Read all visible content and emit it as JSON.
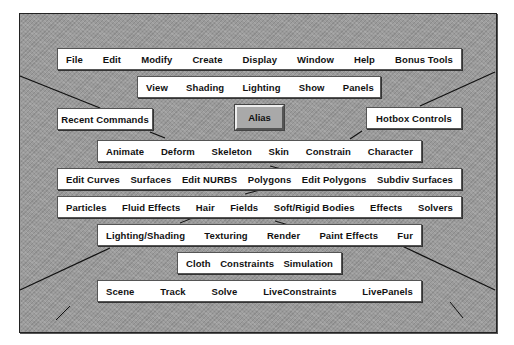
{
  "hotbox": {
    "center_button": "Alias",
    "recent_commands": "Recent Commands",
    "hotbox_controls": "Hotbox Controls",
    "rows": {
      "main_menus": [
        "File",
        "Edit",
        "Modify",
        "Create",
        "Display",
        "Window",
        "Help",
        "Bonus Tools"
      ],
      "panel_menus": [
        "View",
        "Shading",
        "Lighting",
        "Show",
        "Panels"
      ],
      "animation": [
        "Animate",
        "Deform",
        "Skeleton",
        "Skin",
        "Constrain",
        "Character"
      ],
      "modeling": [
        "Edit Curves",
        "Surfaces",
        "Edit NURBS",
        "Polygons",
        "Edit Polygons",
        "Subdiv Surfaces"
      ],
      "dynamics": [
        "Particles",
        "Fluid Effects",
        "Hair",
        "Fields",
        "Soft/Rigid Bodies",
        "Effects",
        "Solvers"
      ],
      "rendering": [
        "Lighting/Shading",
        "Texturing",
        "Render",
        "Paint Effects",
        "Fur"
      ],
      "cloth": [
        "Cloth",
        "Constraints",
        "Simulation"
      ],
      "live": [
        "Scene",
        "Track",
        "Solve",
        "LiveConstraints",
        "LivePanels"
      ]
    }
  },
  "colors": {
    "viewport_bg": "#9a9a9a",
    "menu_bg": "#ffffff",
    "alias_bg": "#a9a9a9"
  }
}
